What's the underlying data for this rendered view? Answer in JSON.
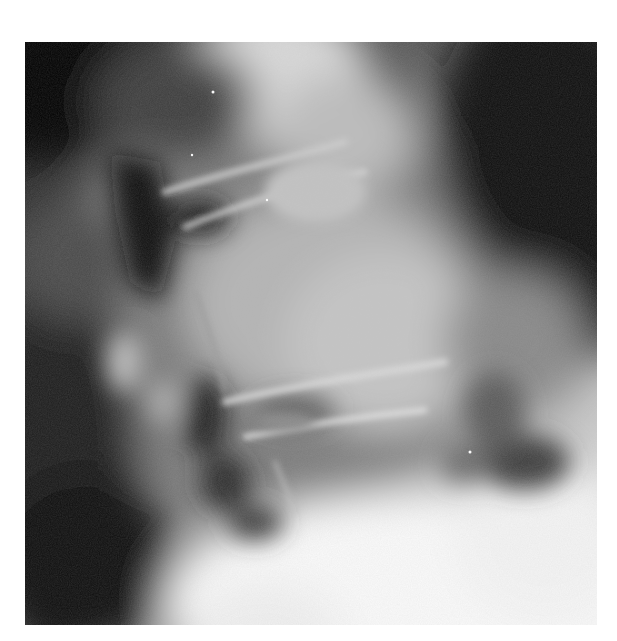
{
  "image": {
    "subject": "Lateral radiograph of the lumbar spine",
    "alt": "Grayscale X-ray showing vertebral bodies, intervertebral disc spaces and surrounding soft tissue",
    "palette": {
      "background": "#ffffff",
      "darkest": "#050505",
      "dark": "#2a2a2a",
      "mid": "#7a7a7a",
      "light": "#bdbdbd",
      "brightest": "#f6f6f6"
    },
    "frame": {
      "x": 25,
      "y": 42,
      "width": 572,
      "height": 583
    }
  }
}
